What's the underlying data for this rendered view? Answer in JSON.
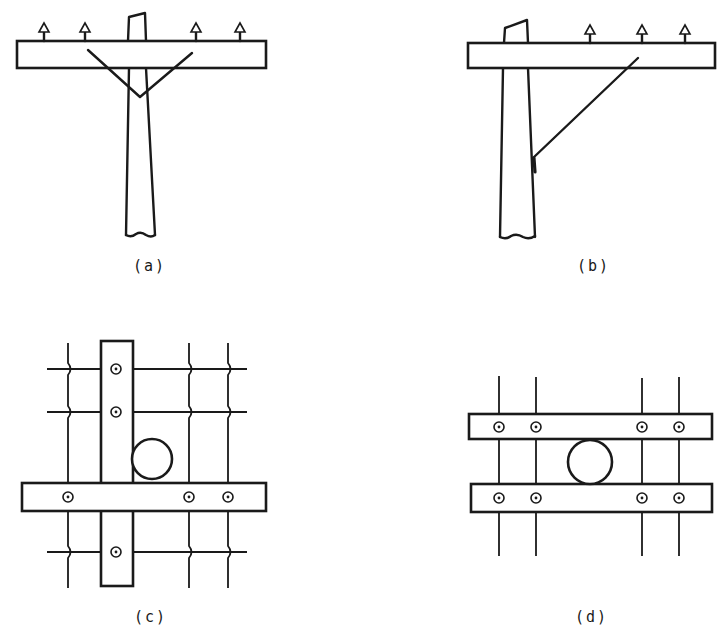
{
  "figure": {
    "panels": [
      {
        "id": "a",
        "label": "(a)",
        "description": "Pole with single crossarm, V-brace, four pin insulators"
      },
      {
        "id": "b",
        "label": "(b)",
        "description": "Pole with side-mounted crossarm, single diagonal brace, three pin insulators"
      },
      {
        "id": "c",
        "label": "(c)",
        "description": "Top view: crossarm crossing vertical member, pole circle, wire crossings with insulators"
      },
      {
        "id": "d",
        "label": "(d)",
        "description": "Top view: double crossarm with pole between, four wires with insulators"
      }
    ],
    "colors": {
      "ink": "#1a1a1a",
      "background": "#ffffff"
    }
  }
}
